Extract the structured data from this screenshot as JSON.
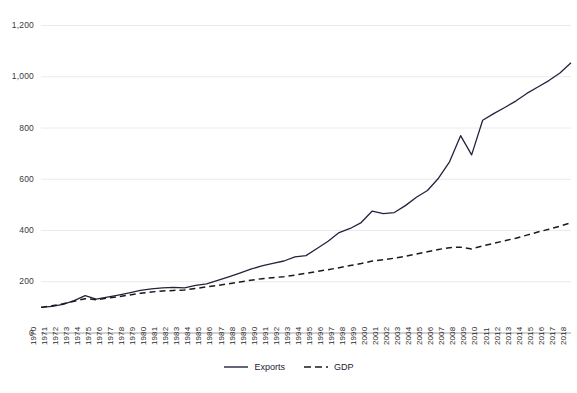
{
  "chart_data": {
    "type": "line",
    "title": "",
    "xlabel": "",
    "ylabel": "",
    "ylim": [
      0,
      1200
    ],
    "yticks": [
      "0",
      "200",
      "400",
      "600",
      "800",
      "1,000",
      "1,200"
    ],
    "ytick_values": [
      0,
      200,
      400,
      600,
      800,
      1000,
      1200
    ],
    "grid": true,
    "legend_position": "bottom-center",
    "categories": [
      "1970",
      "1971",
      "1972",
      "1973",
      "1974",
      "1975",
      "1976",
      "1977",
      "1978",
      "1979",
      "1980",
      "1981",
      "1982",
      "1983",
      "1984",
      "1985",
      "1986",
      "1987",
      "1988",
      "1989",
      "1990",
      "1991",
      "1992",
      "1993",
      "1994",
      "1995",
      "1996",
      "1997",
      "1998",
      "1999",
      "2000",
      "2001",
      "2002",
      "2003",
      "2004",
      "2005",
      "2006",
      "2007",
      "2008",
      "2009",
      "2010",
      "2011",
      "2012",
      "2013",
      "2014",
      "2015",
      "2016",
      "2017",
      "2018"
    ],
    "series": [
      {
        "name": "Exports",
        "style": "solid",
        "color": "#23233f",
        "values": [
          100,
          104,
          112,
          126,
          146,
          132,
          140,
          148,
          157,
          166,
          172,
          176,
          178,
          176,
          186,
          192,
          205,
          219,
          234,
          249,
          262,
          272,
          281,
          297,
          302,
          330,
          358,
          392,
          408,
          431,
          476,
          466,
          470,
          497,
          530,
          556,
          604,
          668,
          770,
          695,
          830,
          856,
          880,
          905,
          935,
          960,
          985,
          1015,
          1055
        ]
      },
      {
        "name": "GDP",
        "style": "dashed",
        "color": "#1a1a1a",
        "values": [
          100,
          106,
          114,
          124,
          134,
          130,
          136,
          142,
          148,
          155,
          160,
          164,
          166,
          168,
          174,
          180,
          186,
          192,
          199,
          206,
          212,
          216,
          220,
          226,
          233,
          240,
          247,
          255,
          263,
          271,
          281,
          286,
          292,
          299,
          308,
          317,
          326,
          333,
          335,
          328,
          340,
          350,
          360,
          370,
          382,
          394,
          405,
          417,
          430
        ]
      }
    ]
  },
  "legend": {
    "items": [
      {
        "label": "Exports",
        "style": "solid"
      },
      {
        "label": "GDP",
        "style": "dashed"
      }
    ]
  },
  "caption": {
    "text": ""
  }
}
